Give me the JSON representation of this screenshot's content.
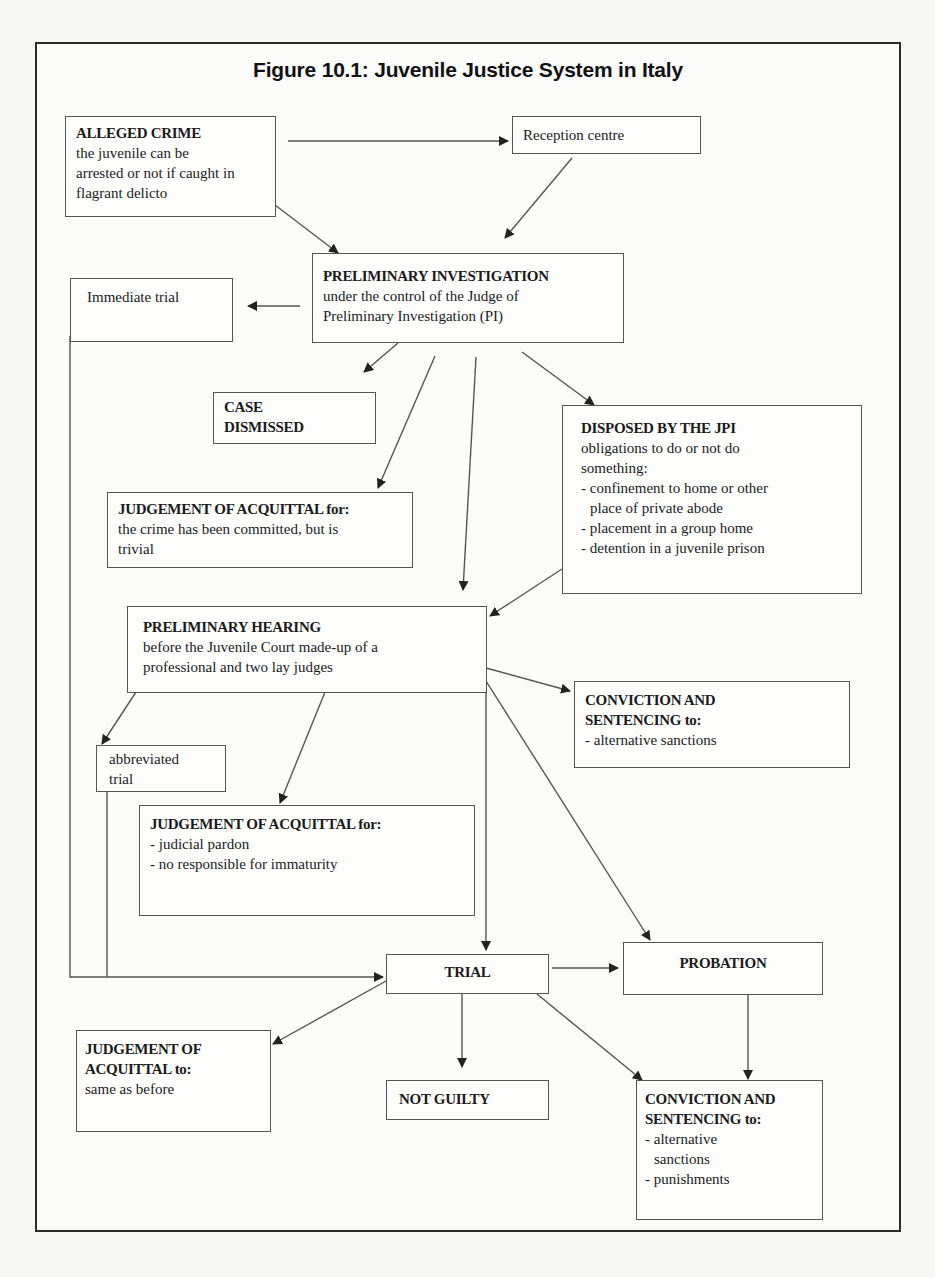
{
  "title": "Figure 10.1: Juvenile Justice System in Italy",
  "nodes": {
    "alleged_crime": {
      "head": "ALLEGED CRIME",
      "lines": [
        "the juvenile can be",
        "arrested or not if caught in",
        "flagrant delicto"
      ]
    },
    "reception_centre": {
      "lines": [
        "Reception centre"
      ]
    },
    "preliminary_investigation": {
      "head": "PRELIMINARY INVESTIGATION",
      "lines": [
        "under the control of the Judge of",
        "Preliminary Investigation (PI)"
      ]
    },
    "immediate_trial": {
      "lines": [
        "Immediate trial"
      ]
    },
    "case_dismissed": {
      "head_lines": [
        "CASE",
        "DISMISSED"
      ]
    },
    "disposed_by_jpi": {
      "head": "DISPOSED BY THE JPI",
      "lines": [
        "obligations to do or not do",
        "something:",
        "- confinement to home or other",
        "place of private abode",
        "- placement in a group home",
        "- detention in a juvenile prison"
      ]
    },
    "acquittal_trivial": {
      "head": "JUDGEMENT OF ACQUITTAL for:",
      "lines": [
        "the crime has been committed, but is",
        "trivial"
      ]
    },
    "preliminary_hearing": {
      "head": "PRELIMINARY HEARING",
      "lines": [
        "before the Juvenile Court made-up of a",
        "professional and two lay judges"
      ]
    },
    "conviction_alternative": {
      "head_lines": [
        "CONVICTION AND",
        "SENTENCING to:"
      ],
      "lines": [
        "- alternative sanctions"
      ]
    },
    "abbreviated_trial": {
      "lines": [
        "abbreviated",
        "trial"
      ]
    },
    "acquittal_pardon": {
      "head": "JUDGEMENT OF ACQUITTAL for:",
      "lines": [
        "- judicial pardon",
        "- no responsible for immaturity"
      ]
    },
    "trial": {
      "head": "TRIAL"
    },
    "probation": {
      "head": "PROBATION"
    },
    "acquittal_same": {
      "head_lines": [
        "JUDGEMENT OF",
        "ACQUITTAL to:"
      ],
      "lines": [
        "same as before"
      ]
    },
    "not_guilty": {
      "head": "NOT GUILTY"
    },
    "conviction_final": {
      "head_lines": [
        "CONVICTION AND",
        "SENTENCING to:"
      ],
      "lines": [
        "- alternative",
        "sanctions",
        "- punishments"
      ]
    }
  },
  "edges": [
    {
      "from": "alleged_crime",
      "to": "reception_centre"
    },
    {
      "from": "alleged_crime",
      "to": "preliminary_investigation"
    },
    {
      "from": "reception_centre",
      "to": "preliminary_investigation"
    },
    {
      "from": "preliminary_investigation",
      "to": "immediate_trial"
    },
    {
      "from": "preliminary_investigation",
      "to": "case_dismissed"
    },
    {
      "from": "preliminary_investigation",
      "to": "acquittal_trivial"
    },
    {
      "from": "preliminary_investigation",
      "to": "preliminary_hearing"
    },
    {
      "from": "preliminary_investigation",
      "to": "disposed_by_jpi"
    },
    {
      "from": "disposed_by_jpi",
      "to": "preliminary_hearing"
    },
    {
      "from": "immediate_trial",
      "to": "trial"
    },
    {
      "from": "preliminary_hearing",
      "to": "abbreviated_trial"
    },
    {
      "from": "preliminary_hearing",
      "to": "acquittal_pardon"
    },
    {
      "from": "preliminary_hearing",
      "to": "conviction_alternative"
    },
    {
      "from": "preliminary_hearing",
      "to": "probation"
    },
    {
      "from": "preliminary_hearing",
      "to": "trial"
    },
    {
      "from": "abbreviated_trial",
      "to": "trial"
    },
    {
      "from": "trial",
      "to": "probation"
    },
    {
      "from": "trial",
      "to": "acquittal_same"
    },
    {
      "from": "trial",
      "to": "not_guilty"
    },
    {
      "from": "trial",
      "to": "conviction_final"
    },
    {
      "from": "probation",
      "to": "conviction_final"
    }
  ],
  "colors": {
    "line": "#555555",
    "arrow": "#222222",
    "frame": "#2a2a2a"
  }
}
